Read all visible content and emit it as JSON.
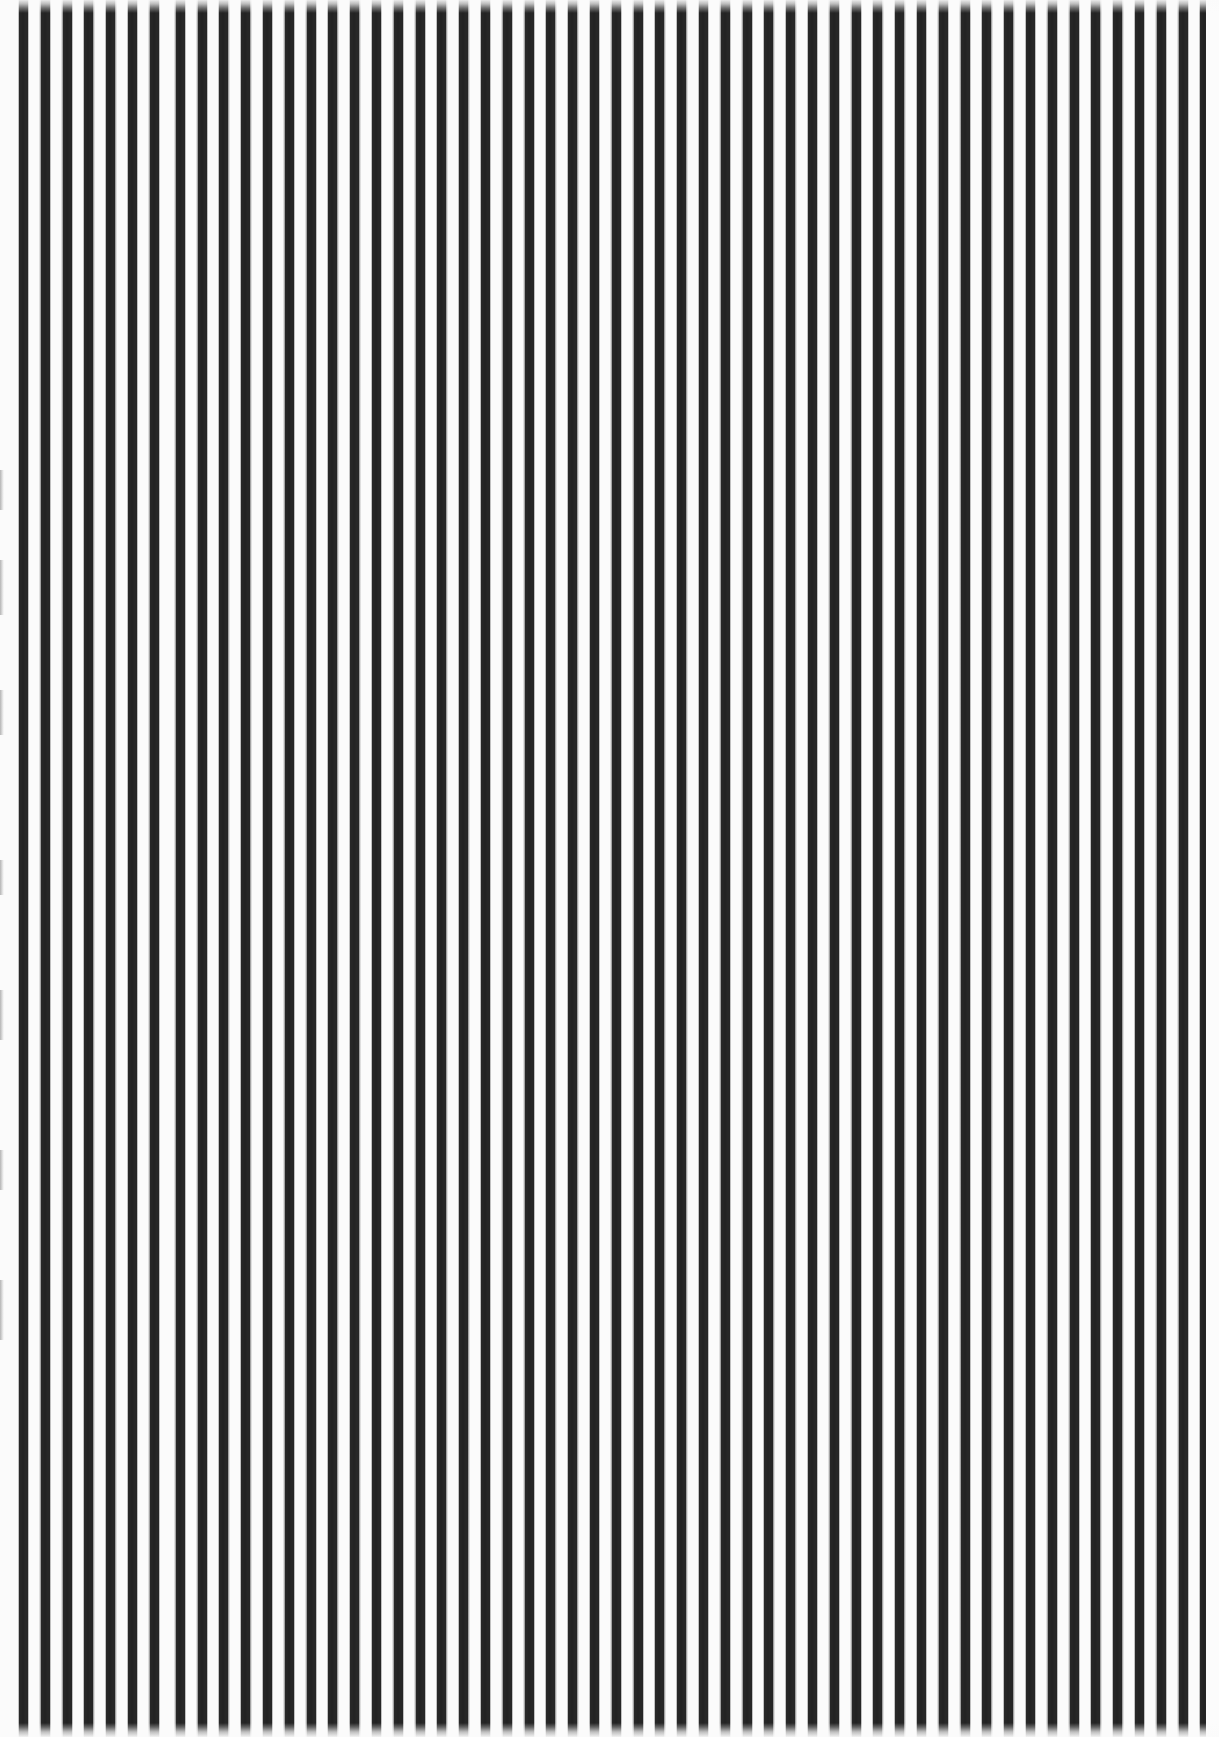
{
  "image": {
    "title": "Vertical Stripe Pattern",
    "description": "High-contrast vertical black-and-white stripe pattern filling the full frame",
    "width": 1219,
    "height": 1737,
    "subject": "striped-surface",
    "capture_note": "scanned / photographed striped surface with soft blur at top and bottom edges"
  },
  "palette": {
    "stripe_dark": "#262626",
    "background_light": "#fbfbfb",
    "page_white": "#ffffff",
    "sliver_gray": "#b4b4b4",
    "right_margin": "#fcfcfc"
  },
  "pattern": {
    "orientation": "vertical",
    "stripe_count": 56,
    "period_px": 21.8,
    "dark_band_px": 9,
    "light_gap_px": 12.8,
    "first_stripe_left_px": 19,
    "last_stripe_right_px": 1205,
    "duty_cycle": 0.41
  },
  "edges": {
    "top_fade_px": 13,
    "bottom_fade_px": 14,
    "left_margin_px": 19,
    "right_margin_px": 13
  },
  "anomalies": [
    {
      "name": "wide-gap",
      "type": "wider-white-gap",
      "x_px": 166,
      "width_px": 17
    },
    {
      "name": "left-edge-sliver-a",
      "type": "clipped-gray-sliver",
      "y_px": 470,
      "height_px": 40
    },
    {
      "name": "left-edge-sliver-b",
      "type": "clipped-gray-sliver",
      "y_px": 560,
      "height_px": 55
    },
    {
      "name": "left-edge-sliver-c",
      "type": "clipped-gray-sliver",
      "y_px": 690,
      "height_px": 45
    },
    {
      "name": "left-edge-sliver-d",
      "type": "clipped-gray-sliver",
      "y_px": 860,
      "height_px": 35
    },
    {
      "name": "left-edge-sliver-e",
      "type": "clipped-gray-sliver",
      "y_px": 990,
      "height_px": 50
    },
    {
      "name": "left-edge-sliver-f",
      "type": "clipped-gray-sliver",
      "y_px": 1150,
      "height_px": 40
    },
    {
      "name": "left-edge-sliver-g",
      "type": "clipped-gray-sliver",
      "y_px": 1280,
      "height_px": 60
    }
  ]
}
